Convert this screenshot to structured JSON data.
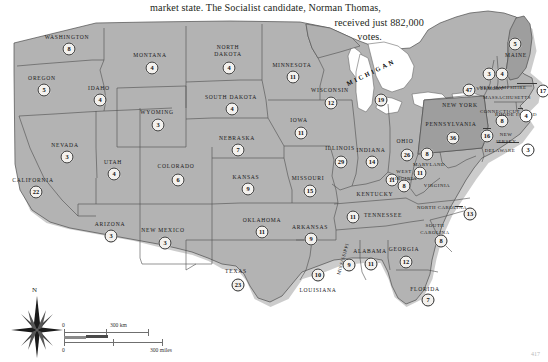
{
  "caption": {
    "line1": "market state. The Socialist candidate, Norman Thomas,",
    "line2": "received just 882,000",
    "line3": "votes."
  },
  "map": {
    "title": "1932 United States presidential election electoral vote map",
    "land_color": "#b3b3b3",
    "highlight_color": "#9a9a9a",
    "water_color": "#ffffff",
    "border_color": "#4d4d4d",
    "badge_fill": "#f3f1ee",
    "badge_stroke": "#2e2e2e"
  },
  "states": [
    {
      "name": "WASHINGTON",
      "ev": "8",
      "lx": 67,
      "ly": 29,
      "bx": 69,
      "by": 41,
      "style": ""
    },
    {
      "name": "OREGON",
      "ev": "5",
      "lx": 42,
      "ly": 70,
      "bx": 44,
      "by": 82,
      "style": ""
    },
    {
      "name": "IDAHO",
      "ev": "4",
      "lx": 99,
      "ly": 80,
      "bx": 100,
      "by": 92,
      "style": ""
    },
    {
      "name": "MONTANA",
      "ev": "4",
      "lx": 150,
      "ly": 47,
      "bx": 152,
      "by": 60,
      "style": ""
    },
    {
      "name": "WYOMING",
      "ev": "3",
      "lx": 157,
      "ly": 104,
      "bx": 158,
      "by": 117,
      "style": ""
    },
    {
      "name": "NEVADA",
      "ev": "3",
      "lx": 65,
      "ly": 137,
      "bx": 67,
      "by": 149,
      "style": ""
    },
    {
      "name": "UTAH",
      "ev": "4",
      "lx": 113,
      "ly": 154,
      "bx": 114,
      "by": 166,
      "style": ""
    },
    {
      "name": "CALIFORNIA",
      "ev": "22",
      "lx": 33,
      "ly": 172,
      "bx": 36,
      "by": 184,
      "style": ""
    },
    {
      "name": "ARIZONA",
      "ev": "3",
      "lx": 110,
      "ly": 216,
      "bx": 111,
      "by": 228,
      "style": ""
    },
    {
      "name": "COLORADO",
      "ev": "6",
      "lx": 176,
      "ly": 158,
      "bx": 178,
      "by": 172,
      "style": ""
    },
    {
      "name": "NEW MEXICO",
      "ev": "3",
      "lx": 163,
      "ly": 222,
      "bx": 165,
      "by": 235,
      "style": ""
    },
    {
      "name": "NORTH DAKOTA",
      "ev": "4",
      "lx": 228,
      "ly": 43,
      "bx": 229,
      "by": 60,
      "style": "two-line"
    },
    {
      "name": "SOUTH DAKOTA",
      "ev": "4",
      "lx": 231,
      "ly": 89,
      "bx": 232,
      "by": 101,
      "style": ""
    },
    {
      "name": "NEBRASKA",
      "ev": "7",
      "lx": 237,
      "ly": 130,
      "bx": 238,
      "by": 142,
      "style": ""
    },
    {
      "name": "KANSAS",
      "ev": "9",
      "lx": 246,
      "ly": 169,
      "bx": 248,
      "by": 181,
      "style": ""
    },
    {
      "name": "OKLAHOMA",
      "ev": "11",
      "lx": 262,
      "ly": 212,
      "bx": 262,
      "by": 224,
      "style": ""
    },
    {
      "name": "TEXAS",
      "ev": "23",
      "lx": 236,
      "ly": 263,
      "bx": 238,
      "by": 277,
      "style": ""
    },
    {
      "name": "MINNESOTA",
      "ev": "11",
      "lx": 292,
      "ly": 57,
      "bx": 293,
      "by": 69,
      "style": ""
    },
    {
      "name": "IOWA",
      "ev": "11",
      "lx": 299,
      "ly": 112,
      "bx": 301,
      "by": 125,
      "style": ""
    },
    {
      "name": "MISSOURI",
      "ev": "15",
      "lx": 308,
      "ly": 170,
      "bx": 310,
      "by": 183,
      "style": ""
    },
    {
      "name": "ARKANSAS",
      "ev": "9",
      "lx": 310,
      "ly": 219,
      "bx": 311,
      "by": 231,
      "style": ""
    },
    {
      "name": "LOUISIANA",
      "ev": "10",
      "lx": 318,
      "ly": 282,
      "bx": 318,
      "by": 267,
      "style": ""
    },
    {
      "name": "WISCONSIN",
      "ev": "12",
      "lx": 330,
      "ly": 82,
      "bx": 331,
      "by": 95,
      "style": ""
    },
    {
      "name": "ILLINOIS",
      "ev": "29",
      "lx": 340,
      "ly": 140,
      "bx": 341,
      "by": 154,
      "style": ""
    },
    {
      "name": "MICHIGAN",
      "ev": "19",
      "lx": 371,
      "ly": 64,
      "bx": 381,
      "by": 92,
      "style": "mich"
    },
    {
      "name": "INDIANA",
      "ev": "14",
      "lx": 371,
      "ly": 142,
      "bx": 372,
      "by": 154,
      "style": ""
    },
    {
      "name": "OHIO",
      "ev": "26",
      "lx": 405,
      "ly": 133,
      "bx": 407,
      "by": 147,
      "style": ""
    },
    {
      "name": "KENTUCKY",
      "ev": "11",
      "lx": 375,
      "ly": 186,
      "bx": 392,
      "by": 172,
      "style": ""
    },
    {
      "name": "TENNESSEE",
      "ev": "11",
      "lx": 383,
      "ly": 207,
      "bx": 353,
      "by": 209,
      "style": ""
    },
    {
      "name": "MISSISSIPPI",
      "ev": "9",
      "lx": 343,
      "ly": 251,
      "bx": 349,
      "by": 257,
      "style": "vert tiny"
    },
    {
      "name": "ALABAMA",
      "ev": "11",
      "lx": 370,
      "ly": 243,
      "bx": 371,
      "by": 256,
      "style": ""
    },
    {
      "name": "GEORGIA",
      "ev": "12",
      "lx": 404,
      "ly": 241,
      "bx": 406,
      "by": 254,
      "style": ""
    },
    {
      "name": "FLORIDA",
      "ev": "7",
      "lx": 425,
      "ly": 281,
      "bx": 428,
      "by": 292,
      "style": ""
    },
    {
      "name": "SOUTH CAROLINA",
      "ev": "8",
      "lx": 435,
      "ly": 221,
      "bx": 441,
      "by": 233,
      "style": "two-line tiny"
    },
    {
      "name": "NORTH CAROLINA",
      "ev": "13",
      "lx": 442,
      "ly": 199,
      "bx": 470,
      "by": 206,
      "style": "tiny"
    },
    {
      "name": "VIRGINIA",
      "ev": "11",
      "lx": 437,
      "ly": 177,
      "bx": 420,
      "by": 165,
      "style": "tiny"
    },
    {
      "name": "WEST VIRGINIA",
      "ev": "8",
      "lx": 404,
      "ly": 167,
      "bx": 404,
      "by": 178,
      "style": "two-line tiny"
    },
    {
      "name": "MARYLAND",
      "ev": "8",
      "lx": 429,
      "ly": 156,
      "bx": 427,
      "by": 146,
      "style": "tiny"
    },
    {
      "name": "DELAWARE",
      "ev": "3",
      "lx": 500,
      "ly": 142,
      "bx": 528,
      "by": 142,
      "style": "tiny"
    },
    {
      "name": "PENNSYLVANIA",
      "ev": "36",
      "lx": 451,
      "ly": 116,
      "bx": 453,
      "by": 130,
      "style": ""
    },
    {
      "name": "NEW JERSEY",
      "ev": "16",
      "lx": 506,
      "ly": 130,
      "bx": 487,
      "by": 128,
      "style": "two-line tiny"
    },
    {
      "name": "NEW YORK",
      "ev": "47",
      "lx": 460,
      "ly": 97,
      "bx": 469,
      "by": 82,
      "style": ""
    },
    {
      "name": "CONNECTICUT",
      "ev": "8",
      "lx": 500,
      "ly": 103,
      "bx": 502,
      "by": 113,
      "style": "tiny"
    },
    {
      "name": "RHODE ISLAND",
      "ev": "4",
      "lx": 516,
      "ly": 106,
      "bx": 526,
      "by": 108,
      "style": "tiny"
    },
    {
      "name": "MASSACHUSETTS",
      "ev": "17",
      "lx": 507,
      "ly": 89,
      "bx": 543,
      "by": 83,
      "style": "tiny"
    },
    {
      "name": "VERMONT",
      "ev": "3",
      "lx": 490,
      "ly": 80,
      "bx": 489,
      "by": 66,
      "style": "tiny"
    },
    {
      "name": "NEW HAMPSHIRE",
      "ev": "4",
      "lx": 503,
      "ly": 79,
      "bx": 502,
      "by": 66,
      "style": "tiny"
    },
    {
      "name": "MAINE",
      "ev": "5",
      "lx": 516,
      "ly": 47,
      "bx": 515,
      "by": 36,
      "style": ""
    }
  ],
  "great_lake_label": "MICHIGAN",
  "compass": {
    "north_letter": "N"
  },
  "scale": {
    "km_zero": "0",
    "km_label": "300 km",
    "miles_zero": "0",
    "miles_label": "300 miles"
  },
  "page_number": "417"
}
